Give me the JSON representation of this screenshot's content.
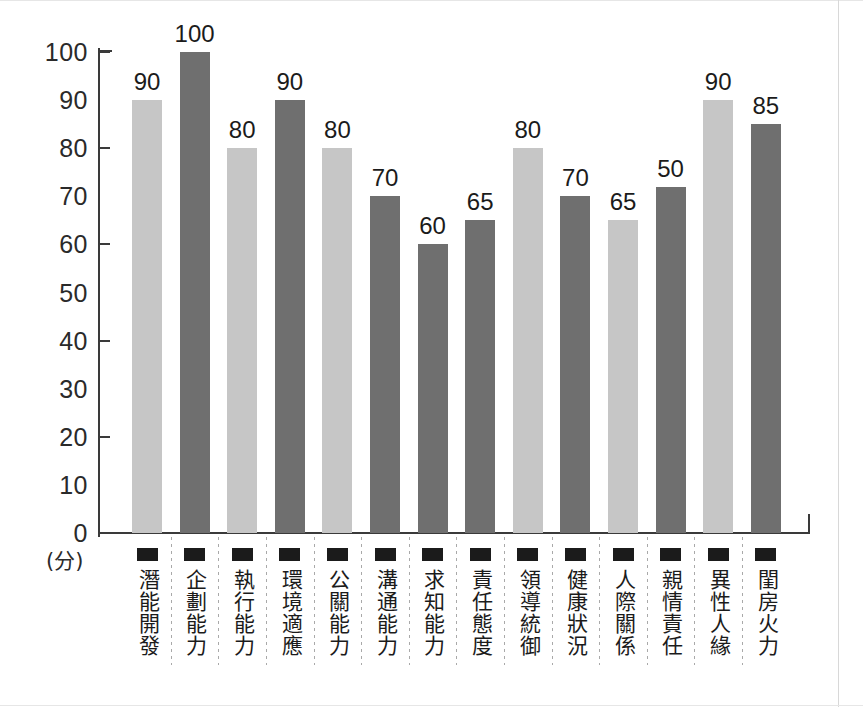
{
  "chart_data": {
    "type": "bar",
    "title": "",
    "xlabel": "",
    "ylabel": "(分)",
    "ylim": [
      0,
      100
    ],
    "yticks": [
      0,
      10,
      20,
      30,
      40,
      50,
      60,
      70,
      80,
      90,
      100
    ],
    "ytick_labels": [
      "0",
      "10",
      "20",
      "30",
      "40",
      "50",
      "60",
      "70",
      "80",
      "90",
      "100"
    ],
    "major_ticks": [
      0,
      20,
      40,
      60,
      80,
      100
    ],
    "grid": false,
    "legend": "none",
    "categories": [
      "潛能開發",
      "企劃能力",
      "執行能力",
      "環境適應",
      "公關能力",
      "溝通能力",
      "求知能力",
      "責任態度",
      "領導統御",
      "健康狀況",
      "人際關係",
      "親情責任",
      "異性人緣",
      "閨房火力"
    ],
    "values": [
      90,
      100,
      80,
      90,
      80,
      70,
      60,
      65,
      80,
      70,
      65,
      50,
      90,
      85
    ],
    "bar_heights": [
      90,
      100,
      80,
      90,
      80,
      70,
      60,
      65,
      80,
      70,
      65,
      72,
      90,
      85
    ],
    "value_labels": [
      "90",
      "100",
      "80",
      "90",
      "80",
      "70",
      "60",
      "65",
      "80",
      "70",
      "65",
      "50",
      "90",
      "85"
    ],
    "bar_shades": [
      "light",
      "dark",
      "light",
      "dark",
      "light",
      "dark",
      "dark",
      "dark",
      "light",
      "dark",
      "light",
      "dark",
      "light",
      "dark"
    ],
    "colors": {
      "light_bar": "#c6c6c6",
      "dark_bar": "#6f6f6f",
      "axis": "#3a3a3a",
      "text": "#1b1b1b",
      "separator": "#a9a9a9",
      "background": "#ffffff"
    }
  }
}
